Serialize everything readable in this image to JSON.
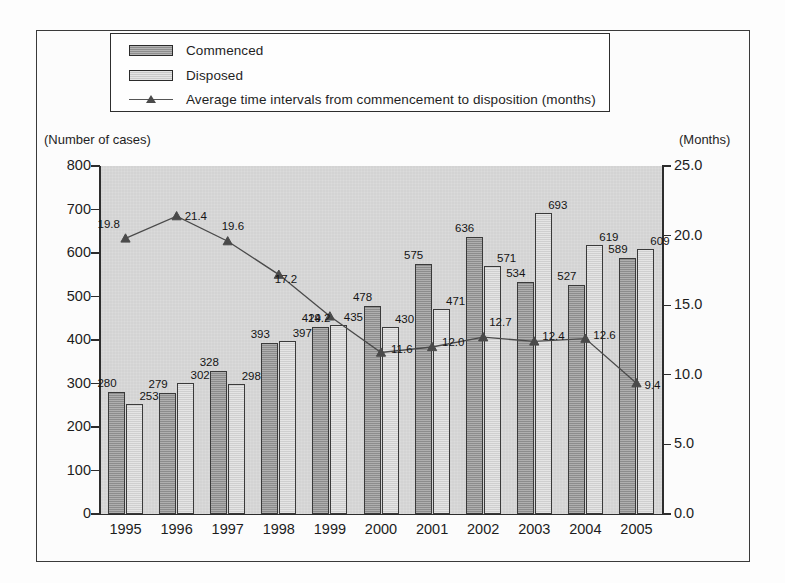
{
  "chart_data": {
    "type": "bar",
    "title": "",
    "xlabel": "",
    "ylabel": "(Number of cases)",
    "y2label": "(Months)",
    "grid": false,
    "legend_position": "top",
    "categories": [
      "1995",
      "1996",
      "1997",
      "1998",
      "1999",
      "2000",
      "2001",
      "2002",
      "2003",
      "2004",
      "2005"
    ],
    "ylim": [
      0,
      800
    ],
    "y2lim": [
      0.0,
      25.0
    ],
    "yticks": [
      "800",
      "700",
      "600",
      "500",
      "400",
      "300",
      "200",
      "100",
      "0"
    ],
    "y2ticks": [
      "25.0",
      "20.0",
      "15.0",
      "10.0",
      "5.0",
      "0.0"
    ],
    "series": [
      {
        "name": "Commenced",
        "type": "bar",
        "axis": "left",
        "color": "#8c8c8c",
        "values": [
          280,
          279,
          328,
          393,
          429,
          478,
          575,
          636,
          534,
          527,
          589
        ]
      },
      {
        "name": "Disposed",
        "type": "bar",
        "axis": "left",
        "color": "#cfcfcf",
        "values": [
          253,
          302,
          298,
          397,
          435,
          430,
          471,
          571,
          693,
          619,
          609
        ]
      },
      {
        "name": "Average time intervals from commencement to disposition (months)",
        "type": "line",
        "axis": "right",
        "color": "#4a4a4a",
        "values": [
          19.8,
          21.4,
          19.6,
          17.2,
          14.2,
          11.6,
          12.0,
          12.7,
          12.4,
          12.6,
          9.4
        ]
      }
    ]
  },
  "legend": {
    "items": [
      {
        "label": "Commenced",
        "marker": "swatch-dark"
      },
      {
        "label": "Disposed",
        "marker": "swatch-light"
      },
      {
        "label": "Average time intervals from commencement to disposition (months)",
        "marker": "line-triangle"
      }
    ]
  },
  "axis_captions": {
    "left": "(Number of cases)",
    "right": "(Months)"
  }
}
